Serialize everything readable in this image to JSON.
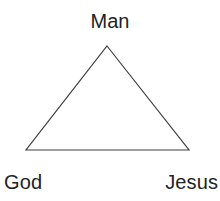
{
  "diagram": {
    "type": "triangle-relationship-diagram",
    "background_color": "#ffffff",
    "stroke_color": "#3f3f3f",
    "stroke_width": 1.2,
    "text_color": "#232323",
    "canvas": {
      "width": 220,
      "height": 201
    },
    "shape": {
      "name": "triangle",
      "points": "107,46 189,150 26,150",
      "fill": "none",
      "vertices": [
        {
          "id": "apex",
          "x": 107,
          "y": 46
        },
        {
          "id": "bottom-right",
          "x": 189,
          "y": 150
        },
        {
          "id": "bottom-left",
          "x": 26,
          "y": 150
        }
      ]
    },
    "labels": {
      "top": "Man",
      "bottom_left": "God",
      "bottom_right": "Jesus"
    }
  }
}
